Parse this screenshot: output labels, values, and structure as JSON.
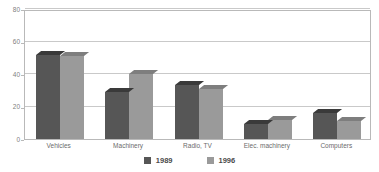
{
  "chart_data": {
    "type": "bar",
    "title": "",
    "subtitle": "",
    "xlabel": "",
    "ylabel": "",
    "ylim": [
      0,
      80
    ],
    "yticks": [
      0,
      20,
      40,
      60,
      80
    ],
    "grid": true,
    "legend_position": "bottom",
    "categories": [
      "Vehicles",
      "Machinery",
      "Radio, TV",
      "Elec. machinery",
      "Computers"
    ],
    "series": [
      {
        "name": "1989",
        "color": "#565656",
        "values": [
          52,
          29,
          33,
          9,
          16
        ]
      },
      {
        "name": "1996",
        "color": "#9a9a9a",
        "values": [
          51,
          40,
          31,
          11.5,
          11
        ]
      }
    ]
  },
  "axis": {
    "y_tick_labels": [
      "80",
      "60",
      "40",
      "20",
      "0"
    ]
  },
  "legend": {
    "items": [
      {
        "label": "1989",
        "color": "#565656"
      },
      {
        "label": "1996",
        "color": "#9a9a9a"
      }
    ]
  },
  "colors": {
    "series_1989": "#565656",
    "series_1996": "#9a9a9a",
    "gridline": "#c9c9c9",
    "frame": "#b9b9b9",
    "tick_text": "#808080",
    "category_text": "#6b6b6b",
    "legend_text": "#4a4a4a",
    "background": "#ffffff"
  }
}
